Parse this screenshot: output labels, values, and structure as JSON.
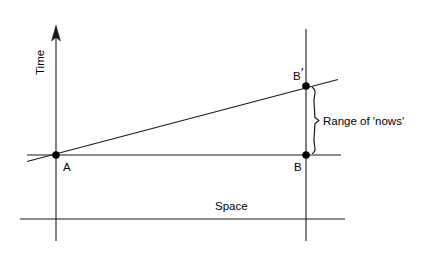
{
  "figure": {
    "background_color": "#ffffff",
    "ink_color": "#1a1a1a",
    "axes": {
      "time_axis_label": "Time",
      "space_axis_label": "Space"
    },
    "points": [
      {
        "id": "A",
        "label": "A",
        "x": 56,
        "y": 155
      },
      {
        "id": "B",
        "label": "B",
        "x": 306,
        "y": 155
      },
      {
        "id": "Bprime",
        "label": "B",
        "prime": "′",
        "x": 306,
        "y": 86
      }
    ],
    "annotations": [
      {
        "id": "range-of-nows",
        "text": "Range of 'nows'"
      }
    ],
    "lines": {
      "simultaneity_line": "horizontal line through A and B",
      "worldline": "slanted line through A and B′",
      "space_line": "lower horizontal reference line",
      "vertical_A": "vertical line at A",
      "vertical_B": "vertical line at B"
    }
  }
}
